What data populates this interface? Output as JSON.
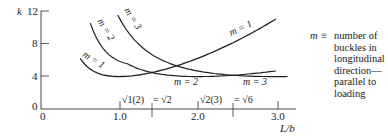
{
  "chart_data": {
    "type": "line",
    "title": "",
    "xlabel": "L/b",
    "ylabel": "k",
    "xlim": [
      0,
      3.2
    ],
    "ylim": [
      0,
      12
    ],
    "x_ticks": [
      "0",
      "1.0",
      "2.0",
      "3.0"
    ],
    "y_ticks": [
      "0",
      "4",
      "8",
      "12"
    ],
    "grid": false,
    "formula": "k = (m b/L + L/(m b))^2",
    "series": [
      {
        "name": "m = 1",
        "x": [
          0.5,
          0.75,
          1.0,
          1.41,
          2.0,
          2.45,
          3.0
        ],
        "values": [
          6.25,
          4.34,
          4.0,
          4.5,
          6.25,
          8.0,
          11.1
        ]
      },
      {
        "name": "m = 2",
        "x": [
          0.63,
          0.8,
          1.0,
          1.41,
          2.0,
          2.45,
          3.0
        ],
        "values": [
          10.6,
          7.29,
          6.25,
          4.5,
          4.0,
          4.08,
          4.34
        ]
      },
      {
        "name": "m = 3",
        "x": [
          0.98,
          1.2,
          1.41,
          2.0,
          2.45,
          3.0,
          3.15
        ],
        "values": [
          11.6,
          8.1,
          6.8,
          4.69,
          4.08,
          4.0,
          4.01
        ]
      }
    ],
    "annotations": [
      {
        "text": "√1(2) = √2",
        "x": 1.414
      },
      {
        "text": "√2(3) = √6",
        "x": 2.449
      }
    ],
    "legend_text": "m ≡ number of buckles in longitudinal direction—parallel to loading"
  },
  "axes": {
    "y_label": "k",
    "x_label": "L/b",
    "y_ticks": [
      "12",
      "8",
      "4",
      "0"
    ],
    "x_ticks": [
      "0",
      "1.0",
      "2.0",
      "3.0"
    ]
  },
  "curve_labels": {
    "m1_left": "m = 1",
    "m2_left": "m = 2",
    "m3_left": "m = 3",
    "m1_right": "m = 1",
    "m2_bottom": "m = 2",
    "m3_bottom": "m = 3"
  },
  "annotations": {
    "a1_left": "√1(2)",
    "a1_right": "= √2",
    "a2_left": "√2(3)",
    "a2_right": "= √6"
  },
  "legend": {
    "symbol": "m ≡",
    "text": "number of\nbuckles in\nlongitudinal\ndirection—\nparallel to\nloading"
  }
}
